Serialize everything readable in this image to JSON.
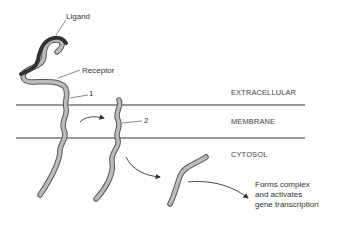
{
  "labels": {
    "ligand": "Ligand",
    "receptor": "Receptor",
    "state1": "1",
    "state2": "2",
    "extracellular": "EXTRACELLULAR",
    "membrane": "MEMBRANE",
    "cytosol": "CYTOSOL",
    "outcome_line1": "Forms complex",
    "outcome_line2": "and activates",
    "outcome_line3": "gene transcription"
  },
  "colors": {
    "receptor_fill": "#b8b8b8",
    "receptor_outline": "#555555",
    "ligand": "#333333",
    "membrane_line": "#333333"
  }
}
